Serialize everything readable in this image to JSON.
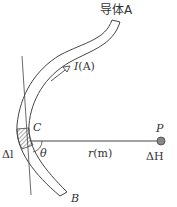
{
  "diagram": {
    "type": "biot-savart-conductor",
    "labels": {
      "conductor": "导体A",
      "current": "I",
      "current_unit": "(A)",
      "point_c": "C",
      "point_p": "P",
      "angle": "θ",
      "distance": "r",
      "distance_unit": "(m)",
      "element": "Δl",
      "field": "ΔH",
      "end_b": "B"
    },
    "colors": {
      "stroke": "#444444",
      "hatch": "#555555",
      "point_fill": "#888888",
      "text": "#333333"
    }
  }
}
